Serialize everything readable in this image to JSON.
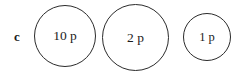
{
  "figure": {
    "panel_label": "c",
    "background_color": "#ffffff",
    "stroke_color": "#2b2b2b",
    "text_color": "#1c1c1c",
    "coins": [
      {
        "name": "coin-10p",
        "label": "10 p",
        "denomination": "10",
        "unit": "p",
        "diameter_px": 62
      },
      {
        "name": "coin-2p",
        "label": "2 p",
        "denomination": "2",
        "unit": "p",
        "diameter_px": 67
      },
      {
        "name": "coin-1p",
        "label": "1 p",
        "denomination": "1",
        "unit": "p",
        "diameter_px": 48
      }
    ]
  }
}
